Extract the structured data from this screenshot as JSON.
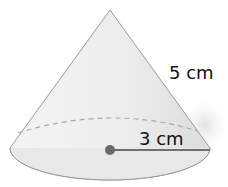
{
  "figure": {
    "shape": "cone",
    "slant_height_label": "5 cm",
    "radius_label": "3 cm",
    "colors": {
      "surface": "#eaeaea",
      "base": "#e6e6e6",
      "outline": "#9a9a9a",
      "dashed_edge": "#a8a8a8",
      "radius_line": "#707070",
      "center_dot": "#6a6a6a",
      "label": "#111111"
    }
  }
}
